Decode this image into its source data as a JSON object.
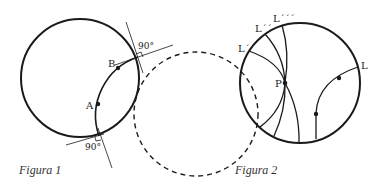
{
  "figure1": {
    "caption": "Figura 1",
    "points": [
      {
        "label": "A"
      },
      {
        "label": "B"
      }
    ],
    "angle_labels": [
      "90°",
      "90°"
    ],
    "description": "Circle with arc AB orthogonal to it; dashed circle continues the arc"
  },
  "figure2": {
    "caption": "Figura 2",
    "point_label": "P",
    "line_labels": [
      "L´",
      "L´´",
      "L´´´",
      "L"
    ],
    "description": "Poincaré disk with several geodesics through P that do not meet line L"
  },
  "colors": {
    "stroke": "#1a1a1a",
    "background": "#ffffff"
  }
}
